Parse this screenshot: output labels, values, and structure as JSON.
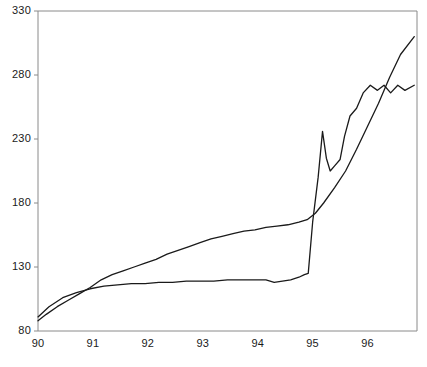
{
  "chart_data": {
    "type": "line",
    "title": "",
    "subtitle": "",
    "xlabel": "",
    "ylabel": "",
    "xlim": [
      90.0,
      96.9
    ],
    "ylim": [
      80,
      330
    ],
    "grid": false,
    "legend": "none",
    "x_ticks": [
      "90",
      "91",
      "92",
      "93",
      "94",
      "95",
      "96"
    ],
    "x_tick_values": [
      90,
      91,
      92,
      93,
      94,
      95,
      96
    ],
    "y_ticks": [
      "80",
      "130",
      "180",
      "230",
      "280",
      "330"
    ],
    "y_tick_values": [
      80,
      130,
      180,
      230,
      280,
      330
    ],
    "line_color": "#1a1a1a",
    "axis_color": "#8a8a8a",
    "background_color": "#ffffff",
    "series": [
      {
        "name": "smooth-series",
        "color": "#1a1a1a",
        "x": [
          90.0,
          90.15,
          90.35,
          90.55,
          90.75,
          90.95,
          91.15,
          91.35,
          91.55,
          91.75,
          91.95,
          92.15,
          92.35,
          92.55,
          92.75,
          92.95,
          93.15,
          93.35,
          93.55,
          93.75,
          93.95,
          94.15,
          94.35,
          94.55,
          94.75,
          94.9,
          95.05,
          95.2,
          95.4,
          95.6,
          95.8,
          96.0,
          96.2,
          96.4,
          96.6,
          96.85
        ],
        "y": [
          88,
          93,
          99,
          104,
          109,
          114,
          120,
          124,
          127,
          130,
          133,
          136,
          140,
          143,
          146,
          149,
          152,
          154,
          156,
          158,
          159,
          161,
          162,
          163,
          165,
          167,
          172,
          180,
          192,
          205,
          222,
          240,
          258,
          278,
          296,
          310
        ]
      },
      {
        "name": "volatile-series",
        "color": "#1a1a1a",
        "x": [
          90.0,
          90.2,
          90.45,
          90.7,
          90.95,
          91.2,
          91.45,
          91.7,
          91.95,
          92.2,
          92.45,
          92.7,
          92.95,
          93.2,
          93.45,
          93.7,
          93.95,
          94.15,
          94.3,
          94.45,
          94.6,
          94.75,
          94.85,
          94.92,
          95.0,
          95.1,
          95.18,
          95.25,
          95.32,
          95.4,
          95.5,
          95.58,
          95.68,
          95.8,
          95.92,
          96.05,
          96.18,
          96.3,
          96.42,
          96.55,
          96.68,
          96.85
        ],
        "y": [
          91,
          99,
          106,
          110,
          113,
          115,
          116,
          117,
          117,
          118,
          118,
          119,
          119,
          119,
          120,
          120,
          120,
          120,
          118,
          119,
          120,
          122,
          124,
          125,
          165,
          200,
          236,
          215,
          205,
          209,
          214,
          232,
          248,
          254,
          266,
          272,
          268,
          272,
          266,
          272,
          268,
          272
        ]
      }
    ]
  }
}
